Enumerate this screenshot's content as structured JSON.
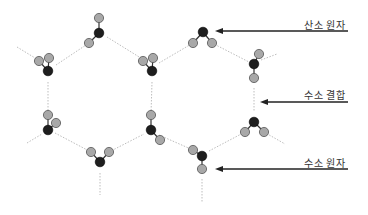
{
  "diagram": {
    "title": "",
    "labels": {
      "oxygen_atom": "산소 원자",
      "hydrogen_bond": "수소 결합",
      "hydrogen_atom": "수소 원자"
    },
    "colors": {
      "oxygen": "#1e1e1e",
      "hydrogen": "#a8a8a8",
      "atom_stroke": "#555555",
      "hbond": "#bdbdbd",
      "arrow": "#222222",
      "text": "#333333"
    },
    "molecules": [
      {
        "o": [
          99,
          33
        ],
        "h": [
          [
            99,
            18
          ],
          [
            89,
            43
          ]
        ]
      },
      {
        "o": [
          48,
          71
        ],
        "h": [
          [
            39,
            61
          ],
          [
            49,
            58
          ]
        ]
      },
      {
        "o": [
          152,
          71
        ],
        "h": [
          [
            143,
            61
          ],
          [
            153,
            58
          ]
        ]
      },
      {
        "o": [
          203,
          32
        ],
        "h": [
          [
            193,
            43
          ],
          [
            212,
            43
          ]
        ]
      },
      {
        "o": [
          254,
          64
        ],
        "h": [
          [
            259,
            54
          ],
          [
            254,
            78
          ]
        ]
      },
      {
        "o": [
          48,
          130
        ],
        "h": [
          [
            48,
            115
          ],
          [
            56,
            123
          ]
        ]
      },
      {
        "o": [
          151,
          130
        ],
        "h": [
          [
            151,
            115
          ],
          [
            160,
            140
          ]
        ]
      },
      {
        "o": [
          100,
          162
        ],
        "h": [
          [
            91,
            152
          ],
          [
            109,
            152
          ]
        ]
      },
      {
        "o": [
          254,
          122
        ],
        "h": [
          [
            245,
            132
          ],
          [
            264,
            132
          ]
        ]
      },
      {
        "o": [
          202,
          156
        ],
        "h": [
          [
            193,
            150
          ],
          [
            202,
            169
          ]
        ]
      }
    ],
    "hydrogen_bonds": [
      [
        [
          56,
          65
        ],
        [
          89,
          43
        ]
      ],
      [
        [
          107,
          37
        ],
        [
          144,
          60
        ]
      ],
      [
        [
          159,
          63
        ],
        [
          193,
          43
        ]
      ],
      [
        [
          212,
          43
        ],
        [
          249,
          62
        ]
      ],
      [
        [
          48,
          82
        ],
        [
          48,
          114
        ]
      ],
      [
        [
          152,
          82
        ],
        [
          151,
          114
        ]
      ],
      [
        [
          254,
          88
        ],
        [
          254,
          111
        ]
      ],
      [
        [
          55,
          133
        ],
        [
          91,
          152
        ]
      ],
      [
        [
          109,
          152
        ],
        [
          144,
          134
        ]
      ],
      [
        [
          159,
          135
        ],
        [
          193,
          150
        ]
      ],
      [
        [
          209,
          151
        ],
        [
          245,
          132
        ]
      ],
      [
        [
          17,
          47
        ],
        [
          40,
          61
        ]
      ],
      [
        [
          27,
          143
        ],
        [
          42,
          134
        ]
      ],
      [
        [
          261,
          60
        ],
        [
          277,
          54
        ]
      ],
      [
        [
          264,
          132
        ],
        [
          285,
          144
        ]
      ],
      [
        [
          100,
          173
        ],
        [
          100,
          195
        ]
      ],
      [
        [
          202,
          179
        ],
        [
          202,
          203
        ]
      ]
    ],
    "arrows": [
      {
        "label_key": "oxygen_atom",
        "from": [
          348,
          31
        ],
        "to": [
          215,
          31
        ],
        "label_pos": [
          345,
          17
        ]
      },
      {
        "label_key": "hydrogen_bond",
        "from": [
          348,
          102
        ],
        "to": [
          260,
          102
        ],
        "label_pos": [
          345,
          87
        ]
      },
      {
        "label_key": "hydrogen_atom",
        "from": [
          348,
          169
        ],
        "to": [
          215,
          169
        ],
        "label_pos": [
          345,
          155
        ]
      }
    ]
  }
}
